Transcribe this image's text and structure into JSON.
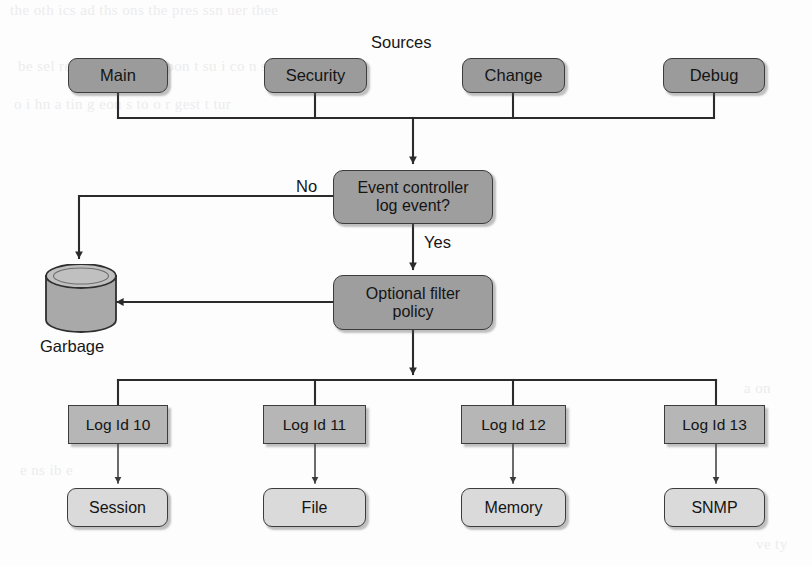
{
  "diagram": {
    "title": "Sources",
    "type": "flowchart",
    "background_color": "#fdfdfd",
    "colors": {
      "source_fill": "#9b9b9b",
      "process_fill": "#9e9e9e",
      "logid_fill": "#b6b6b6",
      "output_fill": "#dadada",
      "stroke": "#3c3c3c",
      "text": "#141414"
    },
    "sources": [
      {
        "label": "Main"
      },
      {
        "label": "Security"
      },
      {
        "label": "Change"
      },
      {
        "label": "Debug"
      }
    ],
    "decision": {
      "line1": "Event controller",
      "line2": "log event?",
      "no_label": "No",
      "yes_label": "Yes"
    },
    "filter": {
      "line1": "Optional filter",
      "line2": "policy"
    },
    "garbage": {
      "label": "Garbage"
    },
    "log_ids": [
      {
        "label": "Log Id 10"
      },
      {
        "label": "Log Id 11"
      },
      {
        "label": "Log Id 12"
      },
      {
        "label": "Log Id 13"
      }
    ],
    "outputs": [
      {
        "label": "Session"
      },
      {
        "label": "File"
      },
      {
        "label": "Memory"
      },
      {
        "label": "SNMP"
      }
    ],
    "bleed_text": {
      "l1": "the oth   ics ad ths   ons  the  pres   ssn  uer   thee",
      "l2": "be  sel  red   i  the  n   the  C  pon  t  su   i  co  n  set",
      "l3": "o i    hn  a tin g  eou   s  to   o r  gest  t  tur",
      "l4": "a on",
      "l5": "e  ns ib e",
      "l6": "ve ty"
    }
  }
}
